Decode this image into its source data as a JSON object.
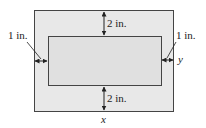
{
  "diagram": {
    "outer_rect": {
      "fill": "#e8e8e8",
      "stroke": "#444444"
    },
    "inner_rect": {
      "fill": "#e2e2e2",
      "stroke": "#444444"
    },
    "labels": {
      "top_margin": "2 in.",
      "bottom_margin": "2 in.",
      "left_margin": "1 in.",
      "right_margin": "1 in.",
      "width_var": "x",
      "height_var": "y"
    }
  }
}
